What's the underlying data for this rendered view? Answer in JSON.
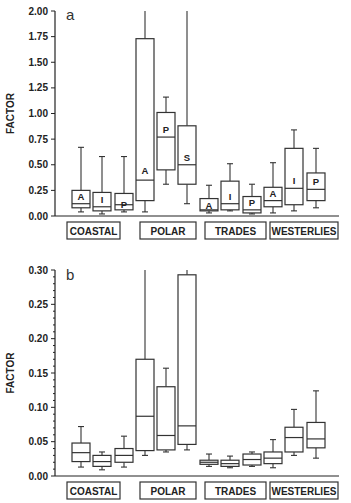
{
  "chart_data": [
    {
      "type": "box",
      "panel_label": "a",
      "ylabel": "FACTOR",
      "ylim": [
        0,
        2.0
      ],
      "yticks": [
        "0.00",
        "0.25",
        "0.50",
        "0.75",
        "1.00",
        "1.25",
        "1.50",
        "1.75",
        "2.00"
      ],
      "groups": [
        "COASTAL",
        "POLAR",
        "TRADES",
        "WESTERLIES"
      ],
      "boxes": [
        {
          "group": "COASTAL",
          "label": "A",
          "min": 0.04,
          "q1": 0.08,
          "median": 0.12,
          "q3": 0.25,
          "max": 0.67
        },
        {
          "group": "COASTAL",
          "label": "I",
          "min": 0.02,
          "q1": 0.05,
          "median": 0.09,
          "q3": 0.23,
          "max": 0.58
        },
        {
          "group": "COASTAL",
          "label": "P",
          "min": 0.04,
          "q1": 0.06,
          "median": 0.11,
          "q3": 0.22,
          "max": 0.58
        },
        {
          "group": "POLAR",
          "label": "A",
          "min": 0.04,
          "q1": 0.15,
          "median": 0.35,
          "q3": 1.73,
          "max": 2.0
        },
        {
          "group": "POLAR",
          "label": "P",
          "min": 0.31,
          "q1": 0.45,
          "median": 0.77,
          "q3": 1.01,
          "max": 1.16
        },
        {
          "group": "POLAR",
          "label": "S",
          "min": 0.12,
          "q1": 0.31,
          "median": 0.5,
          "q3": 0.88,
          "max": 2.0
        },
        {
          "group": "TRADES",
          "label": "A",
          "min": 0.03,
          "q1": 0.05,
          "median": 0.06,
          "q3": 0.17,
          "max": 0.3
        },
        {
          "group": "TRADES",
          "label": "I",
          "min": 0.05,
          "q1": 0.06,
          "median": 0.12,
          "q3": 0.34,
          "max": 0.51
        },
        {
          "group": "TRADES",
          "label": "P",
          "min": 0.02,
          "q1": 0.03,
          "median": 0.06,
          "q3": 0.19,
          "max": 0.31
        },
        {
          "group": "WESTERLIES",
          "label": "A",
          "min": 0.03,
          "q1": 0.09,
          "median": 0.15,
          "q3": 0.28,
          "max": 0.52
        },
        {
          "group": "WESTERLIES",
          "label": "I",
          "min": 0.05,
          "q1": 0.11,
          "median": 0.27,
          "q3": 0.66,
          "max": 0.84
        },
        {
          "group": "WESTERLIES",
          "label": "P",
          "min": 0.08,
          "q1": 0.15,
          "median": 0.26,
          "q3": 0.42,
          "max": 0.66
        }
      ]
    },
    {
      "type": "box",
      "panel_label": "b",
      "ylabel": "FACTOR",
      "ylim": [
        0,
        0.3
      ],
      "yticks": [
        "0.00",
        "0.05",
        "0.10",
        "0.15",
        "0.20",
        "0.25",
        "0.30"
      ],
      "groups": [
        "COASTAL",
        "POLAR",
        "TRADES",
        "WESTERLIES"
      ],
      "boxes": [
        {
          "group": "COASTAL",
          "label": "",
          "min": 0.013,
          "q1": 0.021,
          "median": 0.034,
          "q3": 0.048,
          "max": 0.072
        },
        {
          "group": "COASTAL",
          "label": "",
          "min": 0.009,
          "q1": 0.014,
          "median": 0.021,
          "q3": 0.03,
          "max": 0.035
        },
        {
          "group": "COASTAL",
          "label": "",
          "min": 0.013,
          "q1": 0.02,
          "median": 0.03,
          "q3": 0.04,
          "max": 0.058
        },
        {
          "group": "POLAR",
          "label": "",
          "min": 0.03,
          "q1": 0.037,
          "median": 0.087,
          "q3": 0.17,
          "max": 0.3
        },
        {
          "group": "POLAR",
          "label": "",
          "min": 0.035,
          "q1": 0.038,
          "median": 0.059,
          "q3": 0.13,
          "max": 0.157
        },
        {
          "group": "POLAR",
          "label": "",
          "min": 0.038,
          "q1": 0.046,
          "median": 0.073,
          "q3": 0.293,
          "max": 0.3
        },
        {
          "group": "TRADES",
          "label": "",
          "min": 0.014,
          "q1": 0.017,
          "median": 0.02,
          "q3": 0.023,
          "max": 0.032
        },
        {
          "group": "TRADES",
          "label": "",
          "min": 0.012,
          "q1": 0.014,
          "median": 0.018,
          "q3": 0.023,
          "max": 0.029
        },
        {
          "group": "TRADES",
          "label": "",
          "min": 0.014,
          "q1": 0.016,
          "median": 0.024,
          "q3": 0.032,
          "max": 0.035
        },
        {
          "group": "WESTERLIES",
          "label": "",
          "min": 0.012,
          "q1": 0.018,
          "median": 0.026,
          "q3": 0.035,
          "max": 0.053
        },
        {
          "group": "WESTERLIES",
          "label": "",
          "min": 0.03,
          "q1": 0.035,
          "median": 0.056,
          "q3": 0.071,
          "max": 0.097
        },
        {
          "group": "WESTERLIES",
          "label": "",
          "min": 0.026,
          "q1": 0.041,
          "median": 0.054,
          "q3": 0.078,
          "max": 0.124
        }
      ]
    }
  ]
}
